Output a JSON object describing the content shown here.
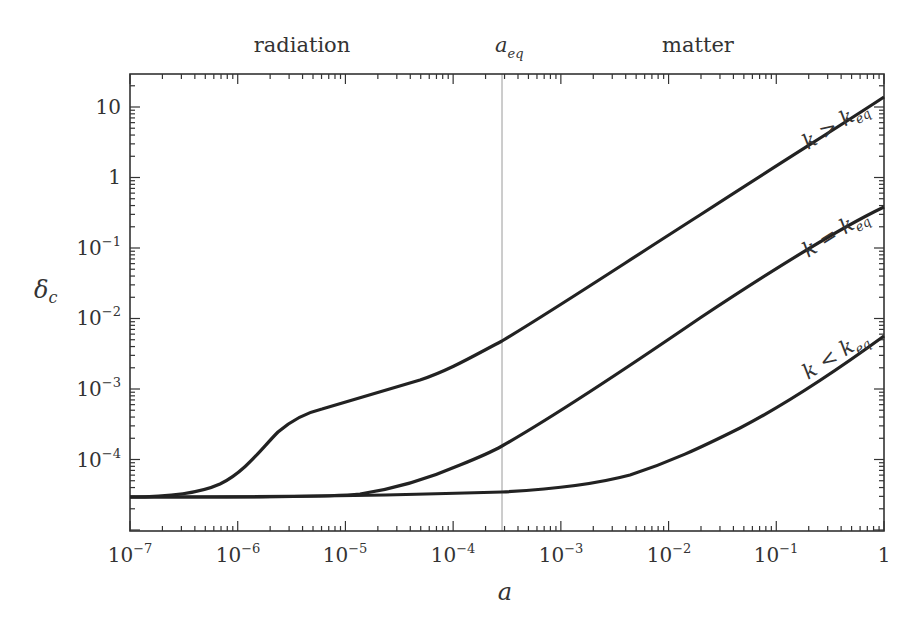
{
  "chart_data": {
    "type": "line",
    "title": "",
    "xlabel": "a",
    "ylabel": "δ_c",
    "xscale": "log",
    "yscale": "log",
    "xlim": [
      1e-07,
      1
    ],
    "ylim": [
      1.3e-05,
      30
    ],
    "grid": false,
    "x_ticks": [
      "10^-7",
      "10^-6",
      "10^-5",
      "10^-4",
      "10^-3",
      "10^-2",
      "10^-1",
      "1"
    ],
    "y_ticks": [
      "10^-4",
      "10^-3",
      "10^-2",
      "10^-1",
      "1",
      "10"
    ],
    "annotations": {
      "top_left": "radiation",
      "top_center": "a_eq",
      "top_right": "matter",
      "vertical_line_at_a": 0.00028
    },
    "series": [
      {
        "name": "k > k_eq",
        "x": [
          1e-07,
          4.5e-07,
          1e-06,
          1.9e-06,
          3.1e-06,
          5.6e-06,
          1.6e-05,
          4.6e-05,
          0.0001,
          0.00028,
          0.0008,
          0.0023,
          0.006,
          0.017,
          0.05,
          0.14,
          0.4,
          1
        ],
        "y": [
          3e-05,
          3.5e-05,
          6e-05,
          0.00016,
          0.00032,
          0.0005,
          0.0008,
          0.0013,
          0.0024,
          0.0046,
          0.013,
          0.04,
          0.11,
          0.33,
          0.95,
          2.7,
          7.3,
          14
        ]
      },
      {
        "name": "k = k_eq",
        "x": [
          1e-07,
          2.7e-05,
          0.0001,
          0.00028,
          0.0008,
          0.0023,
          0.006,
          0.017,
          0.05,
          0.14,
          0.4,
          1
        ],
        "y": [
          3e-05,
          3.1e-05,
          4e-05,
          0.00014,
          0.00035,
          0.001,
          0.003,
          0.009,
          0.027,
          0.074,
          0.19,
          0.4
        ]
      },
      {
        "name": "k < k_eq",
        "x": [
          1e-07,
          0.0001,
          0.00028,
          0.0009,
          0.0023,
          0.005,
          0.01,
          0.022,
          0.05,
          0.1,
          0.25,
          1
        ],
        "y": [
          3e-05,
          3.3e-05,
          3.4e-05,
          3.8e-05,
          4.3e-05,
          6.2e-05,
          0.0001,
          0.00019,
          0.00037,
          0.0008,
          0.0022,
          0.006
        ]
      }
    ]
  },
  "labels": {
    "radiation": "radiation",
    "a_eq_main": "a",
    "a_eq_sub": "eq",
    "matter": "matter",
    "xlabel": "a",
    "ylabel_main": "δ",
    "ylabel_sub": "c",
    "curve_upper": "k > k",
    "curve_middle": "k = k",
    "curve_lower": "k < k",
    "curve_sub": "eq",
    "xt0": "10",
    "xt0e": "−7",
    "xt1": "10",
    "xt1e": "−6",
    "xt2": "10",
    "xt2e": "−5",
    "xt3": "10",
    "xt3e": "−4",
    "xt4": "10",
    "xt4e": "−3",
    "xt5": "10",
    "xt5e": "−2",
    "xt6": "10",
    "xt6e": "−1",
    "xt7": "1",
    "yt0": "10",
    "yt1": "1",
    "yt2": "10",
    "yt2e": "−1",
    "yt3": "10",
    "yt3e": "−2",
    "yt4": "10",
    "yt4e": "−3",
    "yt5": "10",
    "yt5e": "−4"
  }
}
